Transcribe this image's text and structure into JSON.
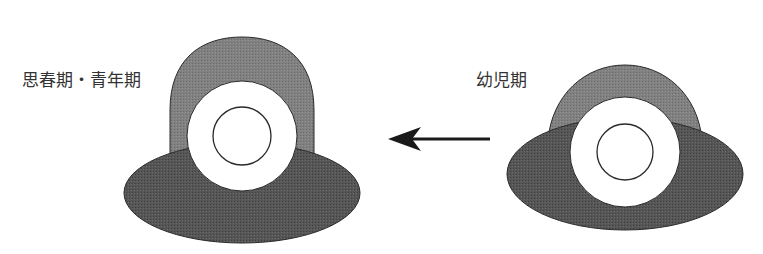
{
  "labels": {
    "left": "思春期・青年期",
    "right": "幼児期"
  },
  "figures": {
    "left": {
      "stage": "思春期・青年期",
      "arch": {
        "cx": 242,
        "top": 37,
        "half_width": 72,
        "bottom": 160
      },
      "ellipse": {
        "cx": 242,
        "cy": 193,
        "rx": 118,
        "ry": 50
      },
      "ring": {
        "cx": 242,
        "cy": 136,
        "r": 55
      },
      "core": {
        "cx": 242,
        "cy": 136,
        "r": 29
      }
    },
    "right": {
      "stage": "幼児期",
      "arch": {
        "cx": 625,
        "top": 65,
        "half_width": 77,
        "bottom": 140
      },
      "ellipse": {
        "cx": 625,
        "cy": 174,
        "rx": 118,
        "ry": 56
      },
      "ring": {
        "cx": 625,
        "cy": 152,
        "r": 55
      },
      "core": {
        "cx": 625,
        "cy": 152,
        "r": 28
      }
    }
  },
  "arrow": {
    "from_x": 490,
    "to_x": 388,
    "y": 139,
    "direction": "left"
  },
  "colors": {
    "arch_fill": "#7d7d7d",
    "ellipse_fill": "#535353",
    "ring_fill": "#ffffff",
    "stroke": "#2a2a2a",
    "arrow": "#1a1a1a",
    "text": "#333333"
  }
}
